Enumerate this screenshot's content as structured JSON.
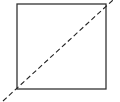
{
  "diagram": {
    "square": {
      "x": 17,
      "y": 4,
      "width": 89,
      "height": 85,
      "stroke": "#333333",
      "stroke_width": 1.3
    },
    "diagonal": {
      "x1": 3,
      "y1": 101,
      "x2": 113,
      "y2": 0,
      "stroke": "#222222",
      "stroke_width": 1.1,
      "dash": "5,3"
    }
  }
}
